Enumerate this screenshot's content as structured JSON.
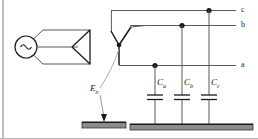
{
  "figure": {
    "kind": "electrical-circuit-schematic",
    "background_color": "#ffffff",
    "line_color": "#1a1a1a",
    "wire_color": "#595959",
    "ground_fill_color": "#8c8c8c",
    "ground_edge_color": "#333333",
    "leader_color": "#a6a6a6",
    "border_color": "#808080"
  },
  "source": {
    "name": "ac-source",
    "symbol": "~",
    "symbol_name": "sine-wave-symbol"
  },
  "windings": {
    "delta": {
      "name": "delta-winding",
      "symbol_name": "triangle-winding-symbol"
    },
    "wye": {
      "name": "wye-winding",
      "symbol_name": "star-winding-symbol"
    }
  },
  "neutral": {
    "label": "E",
    "subscript": "n",
    "full_label": "En",
    "name": "neutral-point-label"
  },
  "phases": [
    {
      "id": "c",
      "label": "c",
      "y": 10
    },
    {
      "id": "b",
      "label": "b",
      "y": 25
    },
    {
      "id": "a",
      "label": "a",
      "y": 65
    }
  ],
  "capacitors": [
    {
      "id": "ca",
      "label": "C",
      "subscript": "a",
      "full_label": "Ca",
      "phase": "a",
      "x": 155
    },
    {
      "id": "cb",
      "label": "C",
      "subscript": "b",
      "full_label": "Cb",
      "phase": "b",
      "x": 182
    },
    {
      "id": "cc",
      "label": "C",
      "subscript": "c",
      "full_label": "Cc",
      "phase": "c",
      "x": 209
    }
  ],
  "grounds": [
    {
      "id": "neutral-ground",
      "name": "neutral-ground-symbol"
    },
    {
      "id": "capacitor-ground",
      "name": "capacitor-ground-bar"
    }
  ]
}
